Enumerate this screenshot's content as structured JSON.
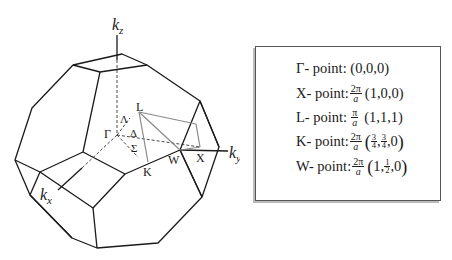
{
  "diagram": {
    "axes": {
      "kz": "k",
      "kz_sub": "z",
      "ky": "k",
      "ky_sub": "y",
      "kx": "k",
      "kx_sub": "x"
    },
    "points": {
      "gamma": "Γ",
      "L": "L",
      "K": "K",
      "W": "W",
      "X": "X",
      "lambda": "Λ",
      "delta": "Δ",
      "sigma": "Σ"
    },
    "colors": {
      "edge": "#1a1a1a",
      "path": "#8a8a8a",
      "hidden": "#333333"
    }
  },
  "legend": {
    "rows": [
      {
        "label": "Γ- point:",
        "prefactor_num": "",
        "prefactor_den": "",
        "coords": "(0,0,0)"
      },
      {
        "label": "X- point:",
        "prefactor_num": "2π",
        "prefactor_den": "a",
        "coords": "(1,0,0)"
      },
      {
        "label": "L- point:",
        "prefactor_num": "π",
        "prefactor_den": "a",
        "coords": "(1,1,1)"
      },
      {
        "label": "K- point:",
        "prefactor_num": "2π",
        "prefactor_den": "a",
        "coords_parts": [
          "3",
          "4",
          "3",
          "4",
          ",0"
        ]
      },
      {
        "label": "W- point:",
        "prefactor_num": "2π",
        "prefactor_den": "a",
        "coords_parts": [
          "1, ",
          "1",
          "2",
          ",0 "
        ]
      }
    ]
  }
}
